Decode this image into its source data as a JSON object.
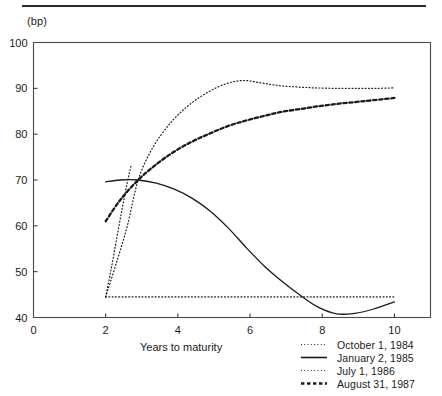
{
  "figure": {
    "unit_label": "(bp)",
    "xaxis_title": "Years to maturity"
  },
  "chart_data": {
    "type": "line",
    "title": "",
    "subtitle": "",
    "xlabel": "Years to maturity",
    "ylabel": "(bp)",
    "xlim": [
      0,
      11
    ],
    "ylim": [
      40,
      100
    ],
    "xticks": [
      0,
      2,
      4,
      6,
      8,
      10
    ],
    "xticklabels": [
      "0",
      "2",
      "4",
      "6",
      "8",
      "10"
    ],
    "yticks": [
      40,
      50,
      60,
      70,
      80,
      90,
      100
    ],
    "yticklabels": [
      "40",
      "50",
      "60",
      "70",
      "80",
      "90",
      "100"
    ],
    "grid": false,
    "legend_position": "bottom-right",
    "series": [
      {
        "name": "October 1, 1984",
        "style": "fine-dotted",
        "color": "#1a1a1a",
        "x": [
          2.0,
          2.3,
          2.6,
          2.9,
          3.3,
          3.8,
          4.3,
          4.8,
          5.3,
          5.8,
          6.3,
          6.8,
          7.3,
          7.8,
          8.4,
          9.0,
          9.5,
          10.0
        ],
        "y": [
          44.5,
          52.0,
          60.0,
          70.0,
          77.0,
          82.5,
          86.3,
          89.0,
          90.9,
          91.7,
          91.2,
          90.6,
          90.3,
          90.1,
          90.0,
          90.0,
          90.0,
          90.1
        ]
      },
      {
        "name": "January 2, 1985",
        "style": "solid",
        "color": "#1a1a1a",
        "x": [
          2.0,
          2.4,
          2.9,
          3.4,
          3.9,
          4.4,
          4.9,
          5.4,
          5.9,
          6.4,
          6.9,
          7.4,
          7.9,
          8.4,
          8.9,
          9.4,
          10.0
        ],
        "y": [
          69.6,
          70.0,
          70.0,
          69.3,
          68.0,
          66.0,
          63.2,
          59.5,
          55.2,
          51.2,
          47.8,
          44.8,
          42.2,
          40.8,
          40.9,
          41.8,
          43.4
        ]
      },
      {
        "name": "July 1, 1986",
        "style": "dotted",
        "color": "#1a1a1a",
        "x": [
          2.0,
          2.15,
          2.3,
          2.45,
          2.6,
          2.7
        ],
        "y": [
          44.5,
          50.5,
          57.0,
          63.5,
          69.5,
          73.0
        ],
        "flat_segment": {
          "x": [
            2.0,
            3.0,
            4.0,
            5.0,
            6.0,
            7.0,
            8.0,
            9.0,
            10.0
          ],
          "y": [
            44.5,
            44.5,
            44.5,
            44.5,
            44.5,
            44.5,
            44.5,
            44.5,
            44.5
          ]
        }
      },
      {
        "name": "August 31, 1987",
        "style": "dashed",
        "color": "#1a1a1a",
        "x": [
          2.0,
          2.4,
          2.9,
          3.4,
          3.9,
          4.4,
          4.9,
          5.4,
          5.9,
          6.4,
          6.9,
          7.4,
          7.9,
          8.4,
          8.9,
          9.4,
          10.0
        ],
        "y": [
          61.0,
          65.6,
          70.0,
          73.4,
          76.2,
          78.4,
          80.2,
          81.8,
          83.0,
          84.0,
          84.9,
          85.5,
          86.1,
          86.6,
          87.0,
          87.4,
          87.9
        ]
      }
    ]
  },
  "legend": {
    "items": [
      {
        "label": "October 1, 1984",
        "style": "fine-dotted"
      },
      {
        "label": "January 2, 1985",
        "style": "solid"
      },
      {
        "label": "July 1, 1986",
        "style": "dotted"
      },
      {
        "label": "August 31, 1987",
        "style": "dashed"
      }
    ]
  }
}
